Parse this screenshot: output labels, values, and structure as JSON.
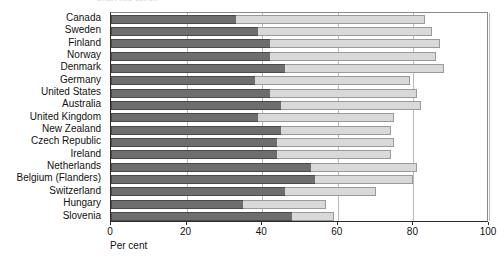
{
  "chart_data": {
    "type": "bar",
    "orientation": "horizontal",
    "stacked": true,
    "title": "",
    "xlabel": "Per cent",
    "ylabel": "",
    "xlim": [
      0,
      100
    ],
    "xticks": [
      0,
      20,
      40,
      60,
      80,
      100
    ],
    "xticklabels": [
      "0",
      "20",
      "40",
      "60",
      "80",
      "100"
    ],
    "grid": true,
    "grid_axis": "x",
    "legend": "none",
    "categories": [
      "Canada",
      "Sweden",
      "Finland",
      "Norway",
      "Denmark",
      "Germany",
      "United States",
      "Australia",
      "United Kingdom",
      "New Zealand",
      "Czech Republic",
      "Ireland",
      "Netherlands",
      "Belgium (Flanders)",
      "Switzerland",
      "Hungary",
      "Slovenia"
    ],
    "series": [
      {
        "name": "lower-segment",
        "color": "#6e6e6e",
        "values": [
          33,
          39,
          42,
          42,
          46,
          38,
          42,
          45,
          39,
          45,
          44,
          44,
          53,
          54,
          46,
          35,
          48
        ]
      },
      {
        "name": "upper-segment",
        "color": "#d9d9d9",
        "values": [
          50,
          46,
          45,
          44,
          42,
          41,
          39,
          37,
          36,
          29,
          31,
          30,
          28,
          26,
          24,
          22,
          11
        ]
      }
    ],
    "totals": [
      83,
      85,
      87,
      86,
      88,
      79,
      81,
      82,
      75,
      74,
      75,
      74,
      81,
      80,
      70,
      57,
      59
    ],
    "top_cut_text": "Chart  title  cut  off"
  },
  "colors": {
    "dark_segment": "#6e6e6e",
    "light_segment": "#d9d9d9",
    "dark_border": "#4a4a4a",
    "light_border": "#9a9a9a",
    "axis": "#2b2b2b",
    "gridline": "#b9b9b9",
    "background": "#ffffff"
  }
}
